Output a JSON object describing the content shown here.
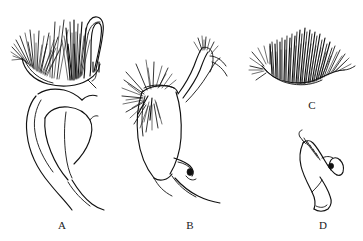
{
  "figure": {
    "background_color": "#ffffff",
    "ink_color": "#111111",
    "width": 363,
    "height": 241,
    "medium": "line-drawing",
    "panel_count": 4
  },
  "panels": [
    {
      "id": "A",
      "label": "A",
      "label_x": 62,
      "label_y": 229,
      "description": "Large rounded lobe with dense apical setal tufts, an elongated looped clasper at upper right, two short parallel tick marks, and a broad inner fold tapering to a slender tail",
      "features": [
        "dense-setal-tuft-apex",
        "looped-clasper",
        "paired-tick-marks",
        "inner-fold-lobe",
        "tapering-tail"
      ]
    },
    {
      "id": "B",
      "label": "B",
      "label_x": 190,
      "label_y": 229,
      "description": "Elongate body bearing a left-facing spray of long setae, a slender curved dorsal arm with a setose tip, and a pointed basal process extending to lower right",
      "features": [
        "lateral-setal-spray",
        "slender-curved-arm",
        "setose-arm-tip",
        "dark-basal-node",
        "pointed-basal-process"
      ]
    },
    {
      "id": "C",
      "label": "C",
      "label_x": 312,
      "label_y": 109,
      "description": "Crescentic sclerite with an undulating margin bearing a dense palisade of long erect setae and splayed setae at the left apex",
      "features": [
        "undulating-margin",
        "dense-erect-setae",
        "splayed-apical-setae"
      ]
    },
    {
      "id": "D",
      "label": "D",
      "label_x": 323,
      "label_y": 229,
      "description": "Small hook-shaped claw with short spines along the upper edge, a rounded inner notch enclosing a small dark node, and a broad rounded base",
      "features": [
        "hooked-apex",
        "marginal-spines",
        "dark-node",
        "rounded-base"
      ]
    }
  ]
}
